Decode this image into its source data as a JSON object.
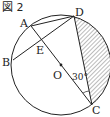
{
  "figure": {
    "title": "図 2",
    "points": {
      "A": "A",
      "B": "B",
      "C": "C",
      "D": "D",
      "E": "E",
      "O": "O"
    },
    "angle_label": "30°",
    "colors": {
      "stroke": "#222222",
      "hatch": "#555555",
      "background": "#ffffff"
    }
  }
}
